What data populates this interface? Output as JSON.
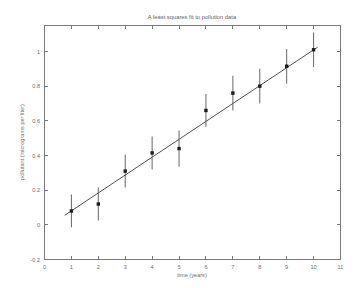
{
  "chart_data": {
    "type": "scatter",
    "title": "A least squares fit to pollution data",
    "xlabel": "time (years)",
    "ylabel": "pollutant (micrograms per liter)",
    "xlim": [
      0,
      11
    ],
    "ylim": [
      -0.2,
      1.15
    ],
    "xticks": [
      0,
      1,
      2,
      3,
      4,
      5,
      6,
      7,
      8,
      9,
      10,
      11
    ],
    "xticklabels": [
      "0",
      "1",
      "2",
      "3",
      "4",
      "5",
      "6",
      "7",
      "8",
      "9",
      "10",
      "11"
    ],
    "yticks": [
      -0.2,
      0,
      0.2,
      0.4,
      0.6,
      0.8,
      1
    ],
    "yticklabels": [
      "-0.2",
      "0",
      "0.2",
      "0.4",
      "0.6",
      "0.8",
      "1"
    ],
    "grid": false,
    "legend": null,
    "x": [
      1,
      2,
      3,
      4,
      5,
      6,
      7,
      8,
      9,
      10
    ],
    "values": [
      0.08,
      0.12,
      0.31,
      0.415,
      0.44,
      0.66,
      0.76,
      0.8,
      0.915,
      1.01
    ],
    "yerr": [
      0.095,
      0.095,
      0.095,
      0.095,
      0.105,
      0.095,
      0.1,
      0.1,
      0.1,
      0.1
    ],
    "series": [
      {
        "name": "pollution measurements",
        "marker": "square",
        "values": [
          0.08,
          0.12,
          0.31,
          0.415,
          0.44,
          0.66,
          0.76,
          0.8,
          0.915,
          1.01
        ]
      },
      {
        "name": "least squares fit",
        "type": "line",
        "x_endpoints": [
          0.75,
          10.15
        ],
        "y_endpoints": [
          0.055,
          1.025
        ],
        "slope": 0.1032,
        "intercept": -0.0224
      }
    ],
    "colors": {
      "marker": "#1c1c1c",
      "errorbar": "#4a4a4a",
      "fit_line": "#3d3d3d",
      "axis": "#7a7a7a",
      "text": "#6e6e6e",
      "background": "#ffffff"
    }
  }
}
